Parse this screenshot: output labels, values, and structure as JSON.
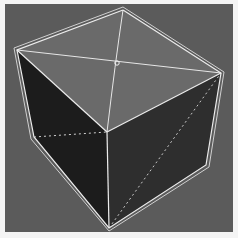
{
  "viewport": {
    "label": "3D viewport",
    "background_color": "#5b5b5b",
    "frame_color": "#f4f4f4"
  },
  "object": {
    "type": "cube",
    "selected": true,
    "faces": {
      "top": {
        "color": "#6a6a6a"
      },
      "left": {
        "color": "#1c1c1c"
      },
      "right": {
        "color": "#2e2e2e"
      }
    },
    "wire_color": "#e6e6e6",
    "hidden_edge_color": "#d8d8d8",
    "top_face_diagonals": true,
    "pivot_marker": true
  }
}
